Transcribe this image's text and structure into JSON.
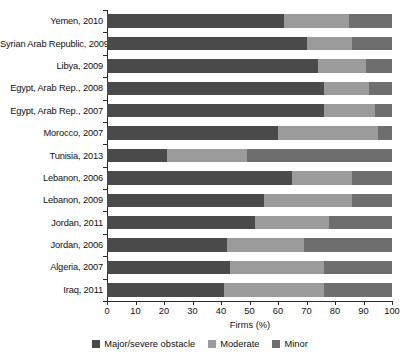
{
  "chart_data": {
    "type": "bar",
    "subtype": "stacked-horizontal-100",
    "title": "",
    "xlabel": "Firms (%)",
    "ylabel": "",
    "xlim": [
      0,
      100
    ],
    "xticks": [
      0,
      10,
      20,
      30,
      40,
      50,
      60,
      70,
      80,
      90,
      100
    ],
    "grid": false,
    "legend_position": "bottom-center",
    "categories": [
      "Yemen, 2010",
      "Syrian Arab Republic, 2009",
      "Libya, 2009",
      "Egypt, Arab Rep., 2008",
      "Egypt, Arab Rep., 2007",
      "Morocco, 2007",
      "Tunisia, 2013",
      "Lebanon, 2006",
      "Lebanon, 2009",
      "Jordan, 2011",
      "Jordan, 2006",
      "Algeria, 2007",
      "Iraq, 2011"
    ],
    "series": [
      {
        "name": "Major/severe obstacle",
        "color": "#4a4a4a",
        "values": [
          62,
          70,
          74,
          76,
          76,
          60,
          21,
          65,
          55,
          52,
          42,
          43,
          41
        ]
      },
      {
        "name": "Moderate",
        "color": "#9b9b9b",
        "values": [
          23,
          16,
          17,
          16,
          18,
          35,
          28,
          21,
          31,
          26,
          27,
          33,
          35
        ]
      },
      {
        "name": "Minor",
        "color": "#6e6e6e",
        "values": [
          15,
          14,
          9,
          8,
          6,
          5,
          51,
          14,
          14,
          22,
          31,
          24,
          24
        ]
      }
    ]
  },
  "axis": {
    "x_title": "Firms (%)",
    "tick_labels": [
      "0",
      "10",
      "20",
      "30",
      "40",
      "50",
      "60",
      "70",
      "80",
      "90",
      "100"
    ]
  },
  "legend": {
    "items": [
      {
        "label": "Major/severe obstacle",
        "color": "#4a4a4a"
      },
      {
        "label": "Moderate",
        "color": "#9b9b9b"
      },
      {
        "label": "Minor",
        "color": "#6e6e6e"
      }
    ]
  }
}
